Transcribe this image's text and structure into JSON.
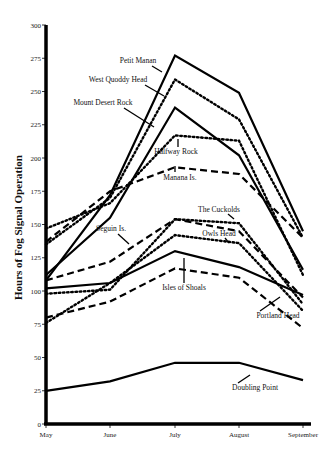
{
  "chart_data": {
    "type": "line",
    "title": "",
    "xlabel": "",
    "ylabel": "Hours of Fog Signal Operation",
    "categories": [
      "May",
      "June",
      "July",
      "August",
      "September"
    ],
    "yticks": [
      0,
      25,
      50,
      75,
      100,
      125,
      150,
      175,
      200,
      225,
      250,
      275,
      300
    ],
    "ylim": [
      0,
      300
    ],
    "grid": false,
    "legend": "inline labels with pointer lines",
    "series": [
      {
        "name": "Petit Manan",
        "style": "solid",
        "values": [
          108,
          172,
          277,
          249,
          145
        ]
      },
      {
        "name": "West Quoddy Head",
        "style": "dotted",
        "values": [
          135,
          170,
          259,
          229,
          140
        ]
      },
      {
        "name": "Mount Desert Rock",
        "style": "solid",
        "values": [
          112,
          155,
          238,
          202,
          116
        ]
      },
      {
        "name": "Halfway Rock",
        "style": "dotted",
        "values": [
          147,
          166,
          217,
          213,
          112
        ]
      },
      {
        "name": "Manana Is.",
        "style": "dashed",
        "values": [
          137,
          175,
          193,
          188,
          140
        ]
      },
      {
        "name": "Seguin Is.",
        "style": "dashed",
        "values": [
          108,
          122,
          154,
          145,
          95
        ]
      },
      {
        "name": "The Cuckolds",
        "style": "dotted",
        "values": [
          98,
          101,
          154,
          151,
          90
        ]
      },
      {
        "name": "Owls Head",
        "style": "dotted",
        "values": [
          76,
          106,
          142,
          136,
          85
        ]
      },
      {
        "name": "Isles of Shoals",
        "style": "solid",
        "values": [
          102,
          106,
          130,
          118,
          97
        ]
      },
      {
        "name": "Portland Head",
        "style": "dashed",
        "values": [
          80,
          92,
          117,
          110,
          72
        ]
      },
      {
        "name": "Doubling Point",
        "style": "solid",
        "values": [
          25,
          32,
          46,
          46,
          33
        ]
      }
    ]
  }
}
